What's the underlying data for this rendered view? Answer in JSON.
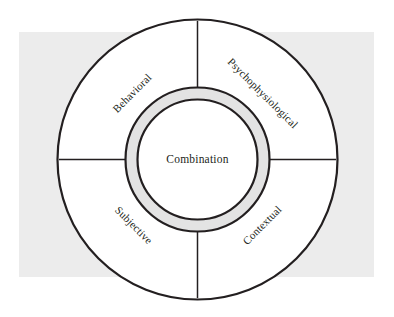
{
  "figure": {
    "type": "radial-segment-diagram",
    "center_label": "Combination",
    "segments": [
      {
        "label": "Behavioral",
        "position": "upper-left",
        "angle_deg": -45
      },
      {
        "label": "Psychophysiological",
        "position": "upper-right",
        "angle_deg": 45
      },
      {
        "label": "Subjective",
        "position": "lower-left",
        "angle_deg": 225
      },
      {
        "label": "Contextual",
        "position": "lower-right",
        "angle_deg": 135
      }
    ],
    "colors": {
      "page_background": "#ffffff",
      "panel_background": "#ececec",
      "circle_fill": "#ffffff",
      "stroke": "#231f20",
      "inner_ring_band": "#e3e3e3",
      "text": "#231f20"
    },
    "geometry": {
      "panel": {
        "x": 19,
        "y": 32,
        "width": 355,
        "height": 245
      },
      "center": {
        "x": 197.5,
        "y": 159.5
      },
      "outer_radius": 140,
      "inner_ring_outer_radius": 72,
      "inner_ring_inner_radius": 60,
      "divider_count": 4,
      "divider_angles_deg": [
        0,
        90,
        180,
        270
      ]
    }
  }
}
